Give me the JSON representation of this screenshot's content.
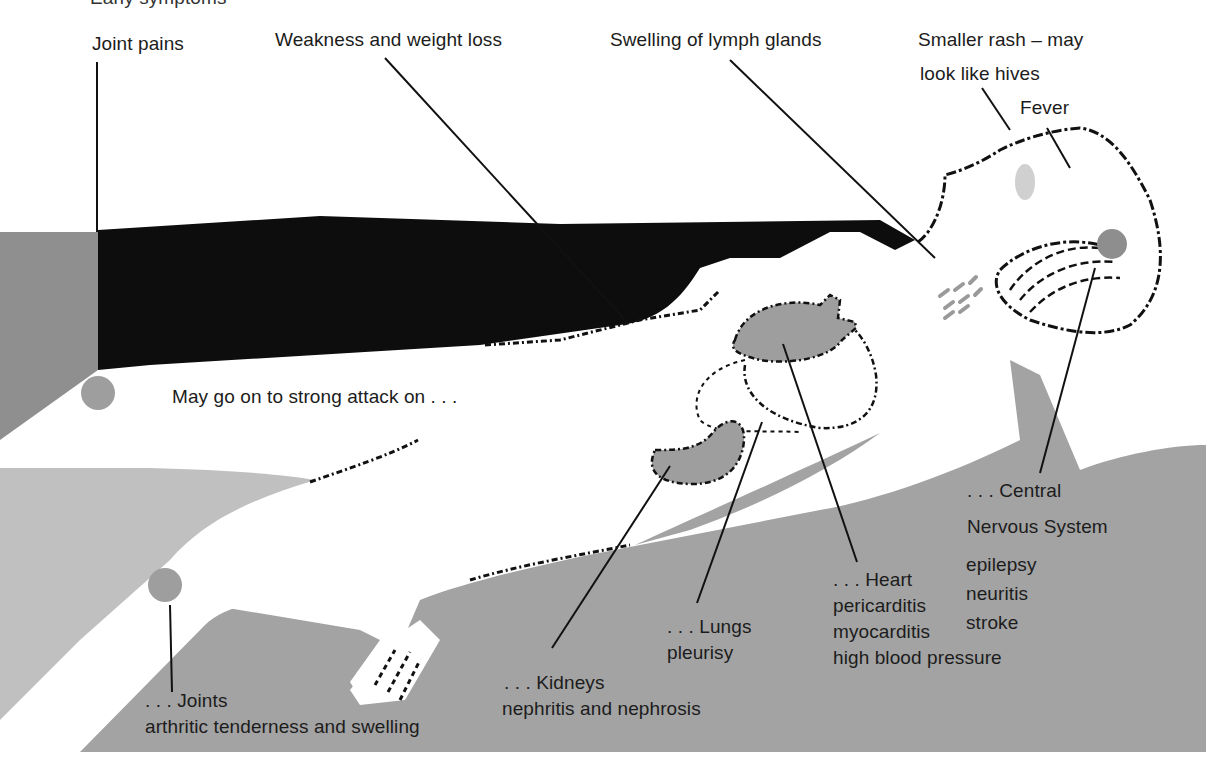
{
  "header": {
    "cropped_title": "Early symptoms"
  },
  "early_symptoms": [
    {
      "id": "joint-pains",
      "label": "Joint pains"
    },
    {
      "id": "weakness",
      "label": "Weakness and weight loss"
    },
    {
      "id": "lymph",
      "label": "Swelling of lymph glands"
    },
    {
      "id": "rash",
      "label_line1": "Smaller rash – may",
      "label_line2": "look like hives"
    },
    {
      "id": "fever",
      "label": "Fever"
    }
  ],
  "transition_text": "May go on to strong attack on . . .",
  "organs": {
    "joints": {
      "title": ". . . Joints",
      "conditions": [
        "arthritic tenderness and swelling"
      ]
    },
    "kidneys": {
      "title": ". . . Kidneys",
      "conditions": [
        "nephritis and nephrosis"
      ]
    },
    "lungs": {
      "title": ". . . Lungs",
      "conditions": [
        "pleurisy"
      ]
    },
    "heart": {
      "title": ". . . Heart",
      "conditions": [
        "pericarditis",
        "myocarditis",
        "high blood pressure"
      ]
    },
    "cns": {
      "title_line1": ". . . Central",
      "title_line2": "Nervous System",
      "conditions": [
        "epilepsy",
        "neuritis",
        "stroke"
      ]
    }
  },
  "colors": {
    "background": "#ffffff",
    "black_band": "#0d0d0d",
    "dark_gray": "#8f8f8f",
    "mid_gray": "#a3a3a3",
    "light_gray": "#c0c0c0",
    "organ_gray": "#9e9e9e",
    "text": "#1c1c1c"
  }
}
